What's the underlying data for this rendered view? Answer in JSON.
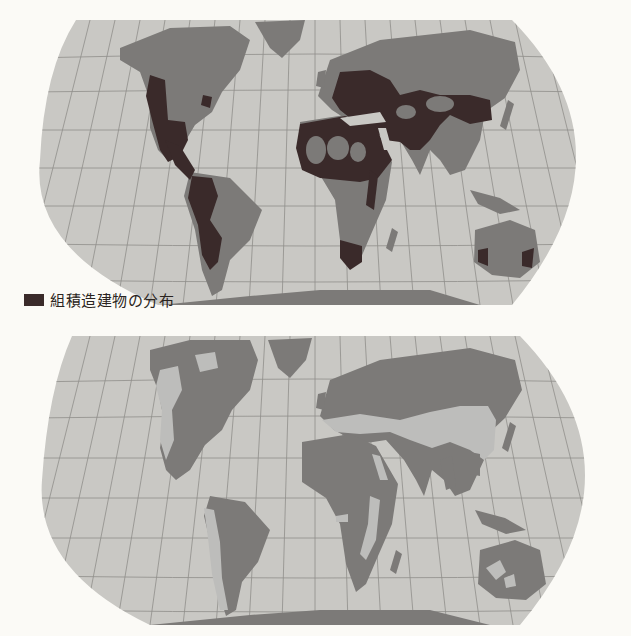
{
  "figure": {
    "panels": [
      {
        "id": "masonry",
        "legend_label": "組積造建物の分布",
        "legend_color": "#3a2a2a",
        "description": "Distribution of masonry buildings"
      },
      {
        "id": "earthquake",
        "legend_label": "地震多発地域の分布",
        "legend_color": "#bdbdbb",
        "description": "Distribution of earthquake-prone regions"
      }
    ],
    "colors": {
      "background": "#fbfaf6",
      "ocean": "#c9c8c4",
      "land": "#7c7a78",
      "masonry": "#3a2a2a",
      "seismic": "#bdbdbb",
      "graticule": "#8f8e8a"
    },
    "projection": "Robinson-like pseudocylindrical world map"
  }
}
